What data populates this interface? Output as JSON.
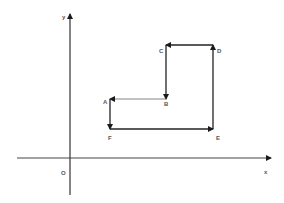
{
  "diagram": {
    "type": "coordinate-path",
    "axes": {
      "x_label": "x",
      "y_label": "y",
      "origin_label": "O",
      "color": "#333333"
    },
    "path_color": "#222222",
    "points": [
      {
        "name": "A",
        "label": "A",
        "x": 110,
        "y": 99
      },
      {
        "name": "B",
        "label": "B",
        "x": 166,
        "y": 99
      },
      {
        "name": "C",
        "label": "C",
        "x": 166,
        "y": 45
      },
      {
        "name": "D",
        "label": "D",
        "x": 213,
        "y": 45
      },
      {
        "name": "E",
        "label": "E",
        "x": 213,
        "y": 129
      },
      {
        "name": "F",
        "label": "F",
        "x": 110,
        "y": 129
      }
    ],
    "path_order": [
      "F",
      "E",
      "D",
      "C",
      "B",
      "A",
      "F"
    ]
  }
}
